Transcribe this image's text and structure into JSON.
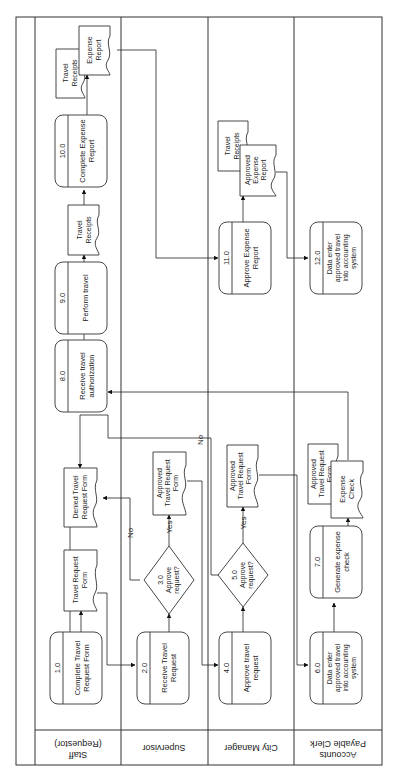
{
  "lanes": [
    {
      "id": "staff",
      "label_lines": [
        "Staff",
        "(Requestor)"
      ]
    },
    {
      "id": "supervisor",
      "label_lines": [
        "Supervisor"
      ]
    },
    {
      "id": "city_manager",
      "label_lines": [
        "City Manager"
      ]
    },
    {
      "id": "ap_clerk",
      "label_lines": [
        "Accounts",
        "Payable Clerk"
      ]
    }
  ],
  "processes": [
    {
      "id": "p1",
      "num": "1.0",
      "lines": [
        "Complete Travel",
        "Request Form"
      ],
      "lane": "staff"
    },
    {
      "id": "p2",
      "num": "2.0",
      "lines": [
        "Receive Travel",
        "Request"
      ],
      "lane": "supervisor"
    },
    {
      "id": "p4",
      "num": "4.0",
      "lines": [
        "Approve travel",
        "request"
      ],
      "lane": "city_manager"
    },
    {
      "id": "p6",
      "num": "6.0",
      "lines": [
        "Data enter",
        "approved travel",
        "into accounting",
        "system"
      ],
      "lane": "ap_clerk"
    },
    {
      "id": "p7",
      "num": "7.0",
      "lines": [
        "Generate expense",
        "check"
      ],
      "lane": "ap_clerk"
    },
    {
      "id": "p8",
      "num": "8.0",
      "lines": [
        "Receive travel",
        "authorization"
      ],
      "lane": "staff"
    },
    {
      "id": "p9",
      "num": "9.0",
      "lines": [
        "Perform travel"
      ],
      "lane": "staff"
    },
    {
      "id": "p10",
      "num": "10.0",
      "lines": [
        "Complete Expense",
        "Report"
      ],
      "lane": "staff"
    },
    {
      "id": "p11",
      "num": "11.0",
      "lines": [
        "Approve Expense",
        "Report"
      ],
      "lane": "city_manager"
    },
    {
      "id": "p12",
      "num": "12.0",
      "lines": [
        "Data enter",
        "approved travel",
        "into accounting",
        "system"
      ],
      "lane": "ap_clerk"
    }
  ],
  "decisions": [
    {
      "id": "d3",
      "num": "3.0",
      "lines": [
        "Approve",
        "request?"
      ],
      "lane": "supervisor"
    },
    {
      "id": "d5",
      "num": "5.0",
      "lines": [
        "Approve",
        "request?"
      ],
      "lane": "city_manager"
    }
  ],
  "documents": [
    {
      "id": "doc_trf",
      "lines": [
        "Travel Request",
        "Form"
      ]
    },
    {
      "id": "doc_denied",
      "lines": [
        "Denied Travel",
        "Request Form"
      ]
    },
    {
      "id": "doc_atrf_sup",
      "lines": [
        "Approved",
        "Travel Request",
        "Form"
      ]
    },
    {
      "id": "doc_atrf_cm",
      "lines": [
        "Approved",
        "Travel Request",
        "Form"
      ]
    },
    {
      "id": "doc_atrf_ap",
      "lines": [
        "Approved",
        "Travel Request",
        "Form"
      ]
    },
    {
      "id": "doc_check",
      "lines": [
        "Expense",
        "Check"
      ]
    },
    {
      "id": "doc_receipts1",
      "lines": [
        "Travel",
        "Receipts"
      ]
    },
    {
      "id": "doc_receipts2",
      "lines": [
        "Travel",
        "Receipts"
      ]
    },
    {
      "id": "doc_expense",
      "lines": [
        "Expense",
        "Report"
      ]
    },
    {
      "id": "doc_receipts3",
      "lines": [
        "Travel",
        "Receipts"
      ]
    },
    {
      "id": "doc_approved_exp",
      "lines": [
        "Approved",
        "Expense",
        "Report"
      ]
    }
  ],
  "edge_labels": {
    "yes": "Yes",
    "no": "No"
  }
}
